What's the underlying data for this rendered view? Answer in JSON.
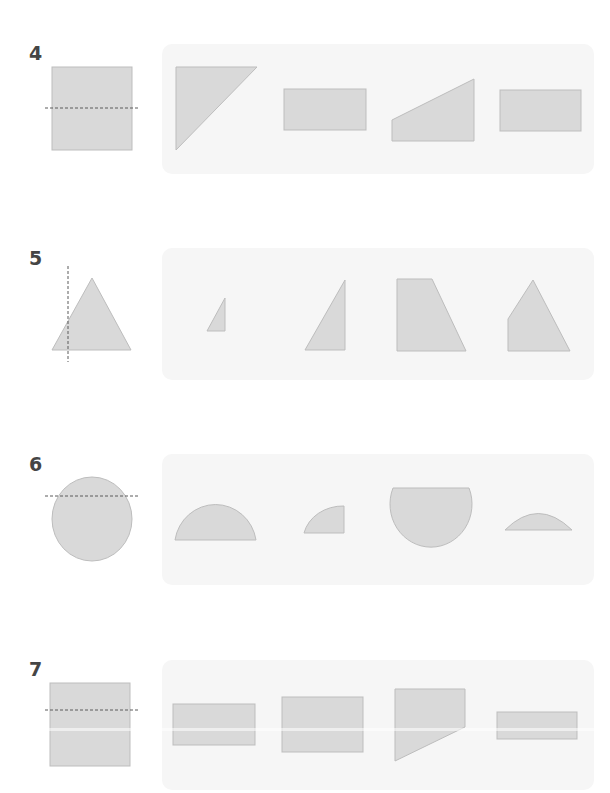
{
  "worksheet": {
    "colors": {
      "shape_fill": "#d9d9d9",
      "shape_stroke": "#bdbdbd",
      "panel_bg": "#f6f6f6",
      "cut_line": "#5a5a5a",
      "number_text": "#454545"
    },
    "questions": [
      {
        "number": "4",
        "original_shape": "square",
        "cut_line": "horizontal dashed line through middle",
        "options": [
          "right triangle",
          "rectangle",
          "right trapezoid",
          "rectangle"
        ]
      },
      {
        "number": "5",
        "original_shape": "triangle",
        "cut_line": "vertical dashed line left of center",
        "options": [
          "small right triangle",
          "right triangle",
          "trapezoid",
          "pentagon"
        ]
      },
      {
        "number": "6",
        "original_shape": "circle",
        "cut_line": "horizontal dashed line near top",
        "options": [
          "semicircle",
          "quarter circle",
          "truncated circle",
          "circular segment"
        ]
      },
      {
        "number": "7",
        "original_shape": "rectangle",
        "cut_line": "horizontal dashed line upper third",
        "options": [
          "rectangle",
          "rectangle",
          "trapezoid",
          "thin rectangle"
        ]
      }
    ]
  }
}
